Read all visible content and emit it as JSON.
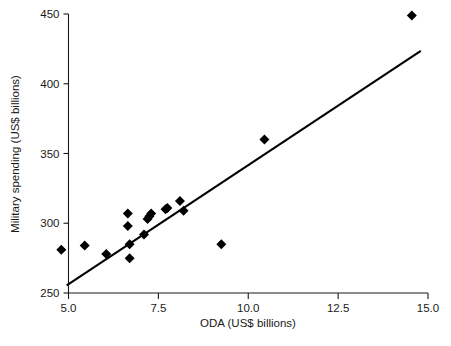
{
  "chart_data": {
    "type": "scatter",
    "title": "",
    "xlabel": "ODA (US$ billions)",
    "ylabel": "Military spending (US$ billions)",
    "xlim": [
      4.35,
      15.35
    ],
    "ylim": [
      250,
      455
    ],
    "xticks": [
      5.0,
      7.5,
      10.0,
      12.5,
      15.0
    ],
    "xtick_labels": [
      "5.0",
      "7.5",
      "10.0",
      "12.5",
      "15.0"
    ],
    "yticks": [
      250,
      300,
      350,
      400,
      450
    ],
    "ytick_labels": [
      "250",
      "300",
      "350",
      "400",
      "450"
    ],
    "grid": false,
    "legend": null,
    "marker_shape": "diamond",
    "marker_color": "#000000",
    "series": [
      {
        "name": "Countries",
        "x": [
          4.8,
          5.45,
          6.05,
          6.65,
          6.65,
          6.7,
          6.7,
          7.1,
          7.2,
          7.25,
          7.3,
          7.7,
          7.75,
          8.1,
          8.2,
          9.25,
          10.45,
          14.55
        ],
        "y": [
          281,
          284,
          278,
          307,
          298,
          285,
          275,
          292,
          303,
          305,
          307,
          310,
          311,
          316,
          309,
          285,
          360,
          449
        ]
      }
    ],
    "trend_line": {
      "name": "Linear fit",
      "color": "#000000",
      "x": [
        4.95,
        14.8
      ],
      "y": [
        255.5,
        423.5
      ]
    }
  },
  "axes": {
    "y_axis_label": "Military spending (US$ billions)",
    "x_axis_label": "ODA (US$ billions)"
  }
}
